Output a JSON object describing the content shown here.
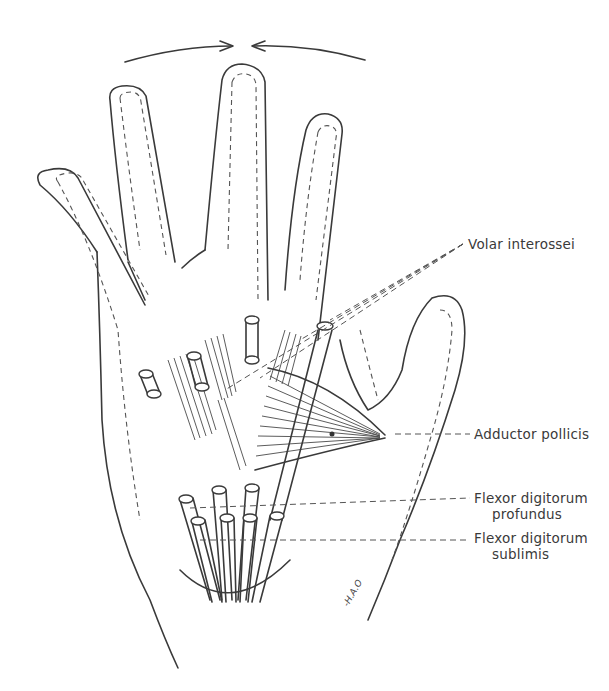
{
  "figure": {
    "motion_arrows": "converging arrows above middle finger (adduction toward midline)"
  },
  "labels": {
    "volar_interossei": "Volar interossei",
    "adductor_pollicis": "Adductor pollicis",
    "flexor_profundus_line1": "Flexor digitorum",
    "flexor_profundus_line2": "profundus",
    "flexor_sublimis_line1": "Flexor digitorum",
    "flexor_sublimis_line2": "sublimis"
  },
  "signature": "-H.A.O"
}
